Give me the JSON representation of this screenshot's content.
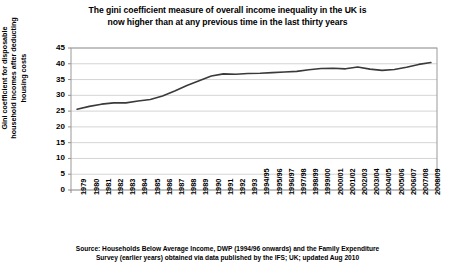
{
  "chart_data": {
    "type": "line",
    "title": "The gini coefficient measure of overall income inequality in the UK is now higher than at any previous time in the last thirty years",
    "title_lines": [
      "The gini coefficient measure of overall income inequality in the UK is",
      "now higher than at any previous time in the last thirty years"
    ],
    "xlabel": "",
    "ylabel": "Gini coefficient for disposable household incomes after deducting housing costs",
    "ylabel_lines": [
      "Gini coefficient for disposable",
      "household incomes after deducting",
      "housing costs"
    ],
    "ylim": [
      0,
      45
    ],
    "ytick_values": [
      0,
      5,
      10,
      15,
      20,
      25,
      30,
      35,
      40,
      45
    ],
    "ytick_labels": [
      "0",
      "5",
      "10",
      "15",
      "20",
      "25",
      "30",
      "35",
      "40",
      "45"
    ],
    "grid": true,
    "legend": "none",
    "line_color": "#3a3a3a",
    "categories": [
      "1979",
      "1980",
      "1981",
      "1982",
      "1983",
      "1984",
      "1985",
      "1986",
      "1987",
      "1988",
      "1989",
      "1990",
      "1991",
      "1992",
      "1993",
      "1994/95",
      "1995/96",
      "1996/97",
      "1997/98",
      "1998/99",
      "1999/00",
      "2000/01",
      "2001/02",
      "2002/03",
      "2003/04",
      "2004/05",
      "2005/06",
      "2006/07",
      "2007/08",
      "2008/09"
    ],
    "values": [
      25.6,
      26.5,
      27.2,
      27.6,
      27.6,
      28.2,
      28.7,
      29.8,
      31.4,
      33.1,
      34.6,
      36.1,
      36.8,
      36.7,
      36.9,
      37.0,
      37.2,
      37.4,
      37.6,
      38.1,
      38.5,
      38.6,
      38.4,
      39.0,
      38.3,
      37.9,
      38.2,
      38.9,
      39.8,
      40.4
    ],
    "source_lines": [
      "Source: Households Below Average Income, DWP (1994/96 onwards) and the Family Expenditure",
      "Survey (earlier years) obtained via data published by the IFS; UK; updated Aug 2010"
    ]
  }
}
